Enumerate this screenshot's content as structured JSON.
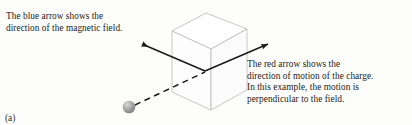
{
  "figure": {
    "label": "(a)",
    "background_color": "#fdfdfc",
    "text_color": "#1b1b1b"
  },
  "captions": {
    "magnetic_field": {
      "name": "magnetic-field-caption",
      "lines": [
        "The blue arrow shows the",
        "direction of the magnetic field."
      ]
    },
    "charge_motion": {
      "name": "charge-motion-caption",
      "lines": [
        "The red arrow shows the",
        "direction of motion of the charge.",
        "In this example, the motion is",
        "perpendicular to the field."
      ]
    }
  },
  "diagram": {
    "box": {
      "name": "field-region-box",
      "description": "transparent rectangular prism representing the magnetic field region",
      "stroke_color": "#b9b9b9",
      "fill_color": "#ffffff",
      "front_face_fill": "#fdfdfd",
      "top_face_fill": "#ffffff"
    },
    "field_arrow": {
      "name": "magnetic-field-arrow",
      "described_color": "blue",
      "rendered_color": "#1a1a1a",
      "style": "solid",
      "double_headed": true,
      "direction": "diagonal, pointing up-left and up-right through the box"
    },
    "motion_arrow": {
      "name": "charge-motion-arrow",
      "described_color": "red",
      "rendered_color": "#1a1a1a",
      "style": "dashed",
      "direction": "from the charge sphere up-right into the box"
    },
    "charge": {
      "name": "charge-sphere",
      "fill_color": "#9a9a9a",
      "highlight_color": "#d8d8d8"
    }
  }
}
